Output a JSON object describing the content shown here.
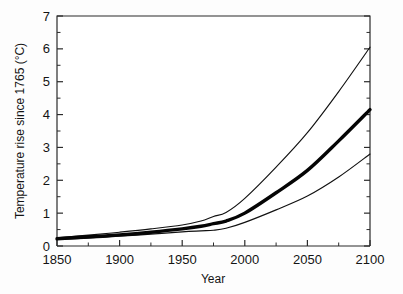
{
  "figure": {
    "background_color": "#fdfdfd",
    "plot_background_color": "#ffffff",
    "line_color": "#111111"
  },
  "axes": {
    "x_title": "Year",
    "y_title": "Temperature rise since 1765 (°C)",
    "x_ticks": [
      "1850",
      "1900",
      "1950",
      "2000",
      "2050",
      "2100"
    ],
    "y_ticks": [
      "0",
      "1",
      "2",
      "3",
      "4",
      "5",
      "6",
      "7"
    ]
  },
  "chart_data": {
    "type": "line",
    "title": "",
    "subtitle": "",
    "xlabel": "Year",
    "ylabel": "Temperature rise since 1765 (°C)",
    "xlim": [
      1850,
      2100
    ],
    "ylim": [
      0,
      7
    ],
    "x_major_tick_interval": 50,
    "x_minor_tick_interval": 25,
    "y_major_tick_interval": 1,
    "y_minor_tick_interval": 0.5,
    "grid": false,
    "legend": false,
    "legend_position": "none",
    "annotations": [],
    "x": [
      1850,
      1875,
      1900,
      1925,
      1950,
      1965,
      1975,
      1985,
      2000,
      2025,
      2050,
      2075,
      2100
    ],
    "series": [
      {
        "name": "High estimate",
        "style": "thin",
        "linewidth": 1.15,
        "color": "#111111",
        "values": [
          0.25,
          0.33,
          0.42,
          0.52,
          0.64,
          0.76,
          0.9,
          1.02,
          1.45,
          2.4,
          3.45,
          4.7,
          6.05
        ]
      },
      {
        "name": "Best estimate",
        "style": "thick",
        "linewidth": 3.4,
        "color": "#050505",
        "values": [
          0.22,
          0.28,
          0.34,
          0.42,
          0.52,
          0.6,
          0.68,
          0.76,
          1.0,
          1.62,
          2.3,
          3.2,
          4.15
        ]
      },
      {
        "name": "Low estimate",
        "style": "thin",
        "linewidth": 1.15,
        "color": "#111111",
        "values": [
          0.2,
          0.24,
          0.3,
          0.36,
          0.43,
          0.46,
          0.48,
          0.54,
          0.72,
          1.1,
          1.52,
          2.1,
          2.8
        ]
      }
    ]
  }
}
